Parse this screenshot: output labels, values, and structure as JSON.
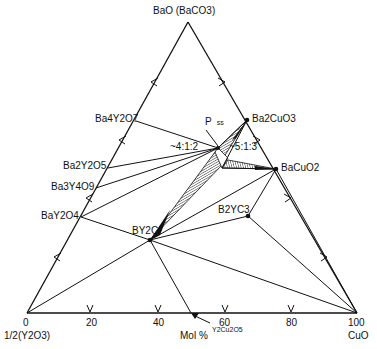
{
  "diagram": {
    "type": "ternary-phase-diagram",
    "vertices": {
      "top": "BaO (BaCO3)",
      "left": "1/2(Y2O3)",
      "right": "CuO"
    },
    "axis": {
      "label": "Mol %",
      "ticks": [
        "0",
        "20",
        "40",
        "60",
        "80",
        "100"
      ]
    },
    "phases": [
      {
        "id": "ba2cuo3",
        "label": "Ba2CuO3"
      },
      {
        "id": "bacuo2",
        "label": "BaCuO2"
      },
      {
        "id": "ba4y2o7",
        "label": "Ba4Y2O7"
      },
      {
        "id": "ba2y2o5",
        "label": "Ba2Y2O5"
      },
      {
        "id": "ba3y4o9",
        "label": "Ba3Y4O9"
      },
      {
        "id": "bay2o4",
        "label": "BaY2O4"
      },
      {
        "id": "by2c",
        "label": "BY2C"
      },
      {
        "id": "b2yc3",
        "label": "B2YC3"
      },
      {
        "id": "y2cu2o5",
        "label": "Y2Cu2O5"
      }
    ],
    "annotations": {
      "p_ss": "P",
      "p_sub": "ss",
      "ratio_412": "~4:1:2",
      "ratio_513": "~5:1:3"
    }
  }
}
